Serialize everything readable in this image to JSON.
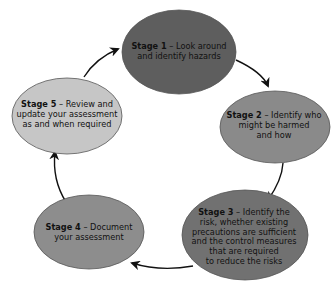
{
  "diagram": {
    "type": "cycle",
    "direction": "clockwise",
    "stages": [
      {
        "id": "stage-1",
        "title": "Stage 1",
        "separator": " – ",
        "lines": [
          "Look around",
          "and identify hazards"
        ],
        "fill": "#5e5e5e"
      },
      {
        "id": "stage-2",
        "title": "Stage 2",
        "separator": " – ",
        "lines": [
          "Identify who",
          "might be harmed",
          "and how"
        ],
        "fill": "#8a8a8a"
      },
      {
        "id": "stage-3",
        "title": "Stage 3",
        "separator": " – ",
        "lines": [
          "Identify the",
          "risk, whether existing",
          "precautions are sufficient",
          "and the control measures",
          "that are required",
          "to reduce the risks"
        ],
        "fill": "#717171"
      },
      {
        "id": "stage-4",
        "title": "Stage 4",
        "separator": " – ",
        "lines": [
          "Document",
          "your assessment"
        ],
        "fill": "#8d8d8d"
      },
      {
        "id": "stage-5",
        "title": "Stage 5",
        "separator": " – ",
        "lines": [
          "Review and",
          "update your assessment",
          "as and when required"
        ],
        "fill": "#c6c6c6"
      }
    ],
    "edges": [
      {
        "from": "stage-1",
        "to": "stage-2"
      },
      {
        "from": "stage-2",
        "to": "stage-3"
      },
      {
        "from": "stage-3",
        "to": "stage-4"
      },
      {
        "from": "stage-4",
        "to": "stage-5"
      },
      {
        "from": "stage-5",
        "to": "stage-1"
      }
    ],
    "colors": {
      "arrow": "#111111",
      "text": "#111111",
      "background": "#ffffff"
    }
  }
}
